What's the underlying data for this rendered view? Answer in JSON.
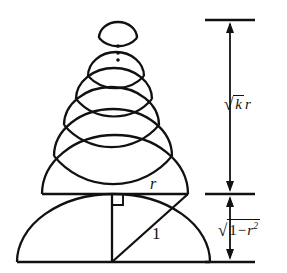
{
  "figure": {
    "background_color": "#ffffff",
    "stroke_color": "#111111",
    "labels": {
      "chord_r": "r",
      "hypotenuse_one": "1",
      "upper_dimension_radical": "√",
      "upper_dimension_radicand": "k",
      "upper_dimension_suffix": "r",
      "lower_dimension_radical": "√",
      "lower_dimension_radicand_one": "1",
      "lower_dimension_minus": "−",
      "lower_dimension_radicand_r": "r",
      "lower_dimension_exponent": "2"
    },
    "dimension_lines": {
      "upper_label_text": "√k r",
      "lower_label_text": "√(1 − r²)",
      "upper_extent_top_y": 20,
      "upper_extent_bottom_y": 194,
      "lower_extent_top_y": 194,
      "lower_extent_bottom_y": 262
    },
    "geometry": {
      "base_semicircle": {
        "left_x": 17,
        "right_x": 210,
        "baseline_y": 262,
        "apex_y": 194
      },
      "chord_line": {
        "x1": 42,
        "x2": 188,
        "y": 194
      },
      "right_angle_marker": {
        "x": 112,
        "y": 194,
        "size": 10
      },
      "vertical_leg": {
        "x": 112,
        "y_top": 194,
        "y_bottom": 262
      },
      "hypotenuse": {
        "x1": 112,
        "y1": 262,
        "x2": 188,
        "y2": 194
      },
      "stacked_semicircles_count": 4,
      "top_lens_shape": true,
      "ellipsis_dots": 3
    }
  }
}
